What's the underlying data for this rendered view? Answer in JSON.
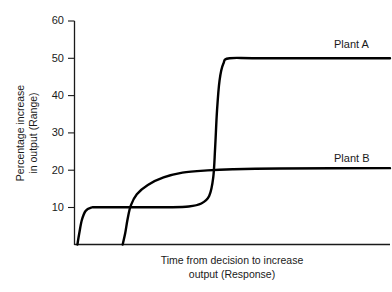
{
  "chart_data": {
    "type": "line",
    "title": "",
    "subtitle": "",
    "xlabel_line1": "Time from decision to increase",
    "xlabel_line2": "output (Response)",
    "ylabel_line1": "Percentage increase",
    "ylabel_line2": "in output (Range)",
    "ylim": [
      0,
      60
    ],
    "yticks": [
      10,
      20,
      30,
      40,
      50,
      60
    ],
    "ytick_labels": [
      "10",
      "20",
      "30",
      "40",
      "50",
      "60"
    ],
    "xticks": [],
    "xtick_labels": [],
    "grid": false,
    "legend_position": "inline-right",
    "line_color": "#000000",
    "axis_color": "#1a1a1a",
    "background_color": "#ffffff",
    "series": [
      {
        "name": "Plant A",
        "label": "Plant A",
        "description": "Two-stage step curve: quick rise to a 10% plateau, long hold, then steep jump to a 50% plateau",
        "plateaus": [
          10,
          50
        ],
        "final_value": 50,
        "points": [
          {
            "x": 0.6,
            "y": 0
          },
          {
            "x": 1.2,
            "y": 3.0
          },
          {
            "x": 2.0,
            "y": 6.5
          },
          {
            "x": 3.2,
            "y": 9.0
          },
          {
            "x": 5.0,
            "y": 9.9
          },
          {
            "x": 7.0,
            "y": 10.0
          },
          {
            "x": 20.0,
            "y": 10.0
          },
          {
            "x": 30.0,
            "y": 10.0
          },
          {
            "x": 36.0,
            "y": 10.2
          },
          {
            "x": 40.0,
            "y": 11.0
          },
          {
            "x": 42.5,
            "y": 13.0
          },
          {
            "x": 43.8,
            "y": 18.0
          },
          {
            "x": 44.4,
            "y": 26.0
          },
          {
            "x": 45.0,
            "y": 36.0
          },
          {
            "x": 45.8,
            "y": 44.0
          },
          {
            "x": 47.0,
            "y": 48.5
          },
          {
            "x": 49.0,
            "y": 50.0
          },
          {
            "x": 60.0,
            "y": 50.0
          },
          {
            "x": 100.0,
            "y": 50.0
          }
        ]
      },
      {
        "name": "Plant B",
        "label": "Plant B",
        "description": "Delayed start, then a single smooth S-shaped rise to a 20% plateau",
        "plateaus": [
          20
        ],
        "final_value": 20,
        "points": [
          {
            "x": 15.0,
            "y": 0
          },
          {
            "x": 15.8,
            "y": 3.0
          },
          {
            "x": 16.6,
            "y": 7.0
          },
          {
            "x": 17.6,
            "y": 10.5
          },
          {
            "x": 19.5,
            "y": 13.5
          },
          {
            "x": 23.0,
            "y": 16.0
          },
          {
            "x": 28.0,
            "y": 18.0
          },
          {
            "x": 34.0,
            "y": 19.3
          },
          {
            "x": 42.0,
            "y": 19.9
          },
          {
            "x": 50.0,
            "y": 20.2
          },
          {
            "x": 65.0,
            "y": 20.4
          },
          {
            "x": 100.0,
            "y": 20.5
          }
        ]
      }
    ],
    "annotations": [
      {
        "text": "Plant A",
        "value": 50,
        "position": "right-above-line"
      },
      {
        "text": "Plant B",
        "value": 20,
        "position": "right-above-line"
      }
    ]
  }
}
